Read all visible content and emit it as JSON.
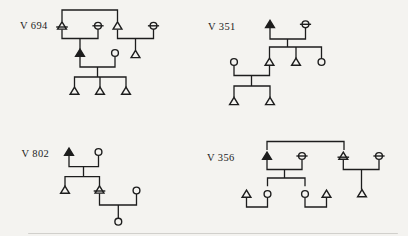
{
  "figure": {
    "background_color": "#f4f3f0",
    "ink_color": "#1d1d1d",
    "line_stroke_width": 1.3,
    "symbol_stroke_width": 1.4,
    "pedigrees": [
      {
        "label": "V 694",
        "label_pos": {
          "x": 20,
          "y": 25.5
        },
        "symbols": [
          {
            "type": "tri-bar",
            "x": 62,
            "y": 25.8
          },
          {
            "type": "circ-bar",
            "x": 98,
            "y": 25.8
          },
          {
            "type": "tri",
            "x": 117.5,
            "y": 25.8
          },
          {
            "type": "circ-bar",
            "x": 153.5,
            "y": 25.8
          },
          {
            "type": "tri-filled",
            "x": 80,
            "y": 53
          },
          {
            "type": "circ",
            "x": 115,
            "y": 53
          },
          {
            "type": "tri",
            "x": 135.5,
            "y": 54.3
          },
          {
            "type": "tri",
            "x": 74.5,
            "y": 91
          },
          {
            "type": "tri",
            "x": 100,
            "y": 91
          },
          {
            "type": "tri",
            "x": 126,
            "y": 91
          }
        ],
        "lines": [
          [
            [
              62,
              21.5
            ],
            [
              62,
              10
            ],
            [
              117.5,
              10
            ],
            [
              117.5,
              21.5
            ]
          ],
          [
            [
              62,
              29.5
            ],
            [
              62,
              38.5
            ],
            [
              98,
              38.5
            ],
            [
              98,
              29.5
            ]
          ],
          [
            [
              80,
              38.5
            ],
            [
              80,
              49.2
            ]
          ],
          [
            [
              117.5,
              29.5
            ],
            [
              117.5,
              38.5
            ],
            [
              153.5,
              38.5
            ],
            [
              153.5,
              29.5
            ]
          ],
          [
            [
              135.5,
              38.5
            ],
            [
              135.5,
              50.5
            ]
          ],
          [
            [
              80,
              56.5
            ],
            [
              80,
              67
            ],
            [
              115,
              67
            ],
            [
              115,
              56.8
            ]
          ],
          [
            [
              97.5,
              67
            ],
            [
              97.5,
              77
            ]
          ],
          [
            [
              74.5,
              87.2
            ],
            [
              74.5,
              77
            ],
            [
              126,
              77
            ],
            [
              126,
              87.2
            ]
          ],
          [
            [
              100,
              77
            ],
            [
              100,
              87.2
            ]
          ]
        ]
      },
      {
        "label": "V 351",
        "label_pos": {
          "x": 208,
          "y": 26.5
        },
        "symbols": [
          {
            "type": "tri-filled",
            "x": 270,
            "y": 24.3
          },
          {
            "type": "circ-bar",
            "x": 305.5,
            "y": 24.3
          },
          {
            "type": "circ",
            "x": 234,
            "y": 62
          },
          {
            "type": "tri",
            "x": 269.5,
            "y": 62
          },
          {
            "type": "tri",
            "x": 296,
            "y": 62
          },
          {
            "type": "circ",
            "x": 321.5,
            "y": 62
          },
          {
            "type": "tri",
            "x": 234,
            "y": 101.3
          },
          {
            "type": "tri",
            "x": 270,
            "y": 101.3
          }
        ],
        "lines": [
          [
            [
              270,
              28
            ],
            [
              270,
              39
            ],
            [
              305.5,
              39
            ],
            [
              305.5,
              28
            ]
          ],
          [
            [
              287.5,
              39
            ],
            [
              287.5,
              47
            ]
          ],
          [
            [
              269.5,
              58.2
            ],
            [
              269.5,
              47
            ],
            [
              321.5,
              47
            ],
            [
              321.5,
              58.5
            ]
          ],
          [
            [
              296,
              47
            ],
            [
              296,
              58.2
            ]
          ],
          [
            [
              234,
              65.5
            ],
            [
              234,
              75.5
            ],
            [
              269.5,
              75.5
            ],
            [
              269.5,
              65.8
            ]
          ],
          [
            [
              251.5,
              75.5
            ],
            [
              251.5,
              86
            ]
          ],
          [
            [
              234,
              97.5
            ],
            [
              234,
              86
            ],
            [
              270,
              86
            ],
            [
              270,
              97.5
            ]
          ]
        ]
      },
      {
        "label": "V 802",
        "label_pos": {
          "x": 21.5,
          "y": 153.5
        },
        "symbols": [
          {
            "type": "tri-filled",
            "x": 69,
            "y": 152
          },
          {
            "type": "circ",
            "x": 98.5,
            "y": 152
          },
          {
            "type": "tri",
            "x": 65,
            "y": 190
          },
          {
            "type": "tri-bar",
            "x": 99.5,
            "y": 189.8
          },
          {
            "type": "circ",
            "x": 136.5,
            "y": 190.5
          },
          {
            "type": "circ",
            "x": 118.3,
            "y": 221.7
          }
        ],
        "lines": [
          [
            [
              69,
              155.5
            ],
            [
              69,
              166.7
            ],
            [
              98.5,
              166.7
            ],
            [
              98.5,
              155.5
            ]
          ],
          [
            [
              83.5,
              166.7
            ],
            [
              83.5,
              176.7
            ]
          ],
          [
            [
              65,
              186.2
            ],
            [
              65,
              176.7
            ],
            [
              99.5,
              176.7
            ],
            [
              99.5,
              186
            ]
          ],
          [
            [
              99.5,
              193.5
            ],
            [
              99.5,
              205
            ],
            [
              136.5,
              205
            ],
            [
              136.5,
              194
            ]
          ],
          [
            [
              118.3,
              205
            ],
            [
              118.3,
              218
            ]
          ]
        ]
      },
      {
        "label": "V 356",
        "label_pos": {
          "x": 207,
          "y": 157.5
        },
        "symbols": [
          {
            "type": "tri-filled",
            "x": 267,
            "y": 156
          },
          {
            "type": "circ-bar",
            "x": 302,
            "y": 156
          },
          {
            "type": "tri-bar",
            "x": 343.3,
            "y": 156
          },
          {
            "type": "circ-bar",
            "x": 379,
            "y": 156
          },
          {
            "type": "tri",
            "x": 246.5,
            "y": 194
          },
          {
            "type": "circ",
            "x": 267.5,
            "y": 194
          },
          {
            "type": "circ",
            "x": 305,
            "y": 194
          },
          {
            "type": "tri",
            "x": 326.5,
            "y": 194
          },
          {
            "type": "tri",
            "x": 362,
            "y": 193.5
          }
        ],
        "lines": [
          [
            [
              267,
              150
            ],
            [
              267,
              141.5
            ],
            [
              344,
              141.5
            ],
            [
              344,
              150
            ]
          ],
          [
            [
              267,
              159.8
            ],
            [
              267,
              169.5
            ],
            [
              302,
              169.5
            ],
            [
              302,
              159.8
            ]
          ],
          [
            [
              284.5,
              169.5
            ],
            [
              284.5,
              178
            ]
          ],
          [
            [
              267.5,
              186.2
            ],
            [
              267.5,
              178
            ],
            [
              305,
              178
            ],
            [
              305,
              186.2
            ]
          ],
          [
            [
              246.5,
              198
            ],
            [
              246.5,
              207
            ],
            [
              267.5,
              207
            ],
            [
              267.5,
              198
            ]
          ],
          [
            [
              305,
              198
            ],
            [
              305,
              207
            ],
            [
              326.5,
              207
            ],
            [
              326.5,
              198
            ]
          ],
          [
            [
              343.3,
              159.8
            ],
            [
              343.3,
              169.5
            ],
            [
              379,
              169.5
            ],
            [
              379,
              159.8
            ]
          ],
          [
            [
              361.5,
              169.5
            ],
            [
              361.5,
              189.7
            ]
          ]
        ]
      }
    ]
  }
}
